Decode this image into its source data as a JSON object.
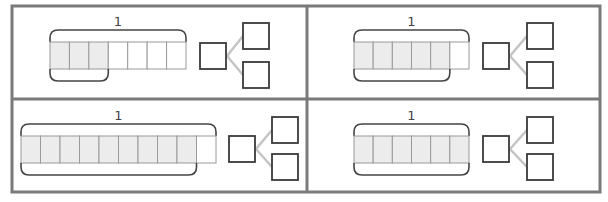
{
  "colors": {
    "frame": "#7a7a7a",
    "cell_border": "#9a9a9a",
    "cell_shaded": "#ececec",
    "cell_empty": "#ffffff",
    "brace": "#444444",
    "box_border": "#3a3a3a",
    "connector": "#c4c4c4",
    "label": "#444444"
  },
  "panels": [
    {
      "id": "top-left",
      "whole_label": "1",
      "total_parts": 7,
      "shaded_parts": 3,
      "bar": {
        "x": 50,
        "y": 42,
        "w": 136,
        "h": 27
      },
      "box": {
        "x": 200,
        "y": 43,
        "s": 26
      },
      "branches": [
        {
          "x": 243,
          "y": 23,
          "s": 26
        },
        {
          "x": 243,
          "y": 62,
          "s": 26
        }
      ]
    },
    {
      "id": "top-right",
      "whole_label": "1",
      "total_parts": 6,
      "shaded_parts": 5,
      "bar": {
        "x": 354,
        "y": 42,
        "w": 115,
        "h": 27
      },
      "box": {
        "x": 483,
        "y": 43,
        "s": 26
      },
      "branches": [
        {
          "x": 527,
          "y": 23,
          "s": 26
        },
        {
          "x": 527,
          "y": 62,
          "s": 26
        }
      ]
    },
    {
      "id": "bottom-left",
      "whole_label": "1",
      "total_parts": 10,
      "shaded_parts": 9,
      "bar": {
        "x": 21,
        "y": 136,
        "w": 195,
        "h": 27
      },
      "box": {
        "x": 229,
        "y": 136,
        "s": 26
      },
      "branches": [
        {
          "x": 272,
          "y": 117,
          "s": 26
        },
        {
          "x": 272,
          "y": 154,
          "s": 26
        }
      ]
    },
    {
      "id": "bottom-right",
      "whole_label": "1",
      "total_parts": 6,
      "shaded_parts": 6,
      "bar": {
        "x": 354,
        "y": 136,
        "w": 115,
        "h": 27
      },
      "box": {
        "x": 483,
        "y": 136,
        "s": 26
      },
      "branches": [
        {
          "x": 527,
          "y": 117,
          "s": 26
        },
        {
          "x": 527,
          "y": 154,
          "s": 26
        }
      ]
    }
  ]
}
